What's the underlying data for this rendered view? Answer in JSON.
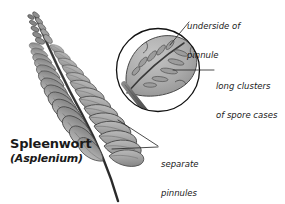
{
  "figure": {
    "background_color": "#ffffff",
    "ink_color": "#1a1a1a"
  },
  "labels": {
    "common_name": "Spleenwort",
    "binomial": "(Asplenium)"
  },
  "annotations": [
    {
      "id": "underside",
      "line1": "underside of",
      "line2": "pinnule"
    },
    {
      "id": "clusters",
      "line1": "long clusters",
      "line2": "of spore cases"
    },
    {
      "id": "separate",
      "line1": "separate",
      "line2": "pinnules"
    }
  ],
  "palette": {
    "leaf_fill": "#a9a9a9",
    "leaf_fill_light": "#bdbdbd",
    "leaf_shadow": "#8d8d8d",
    "leaf_outline": "#4a4a4a",
    "rachis": "#3c3c3c",
    "stalk": "#6e6e6e",
    "sorus": "#9a9a9a",
    "sorus_outline": "#5a5a5a",
    "circle_outline": "#111111",
    "leader_line": "#2a2a2a"
  },
  "geometry": {
    "canvas": {
      "width": 285,
      "height": 204
    },
    "inset_circle": {
      "cx": 158,
      "cy": 70,
      "r": 42
    },
    "frond": {
      "tip_x": 33,
      "tip_y": 12,
      "base_x": 119,
      "base_y": 201
    }
  }
}
